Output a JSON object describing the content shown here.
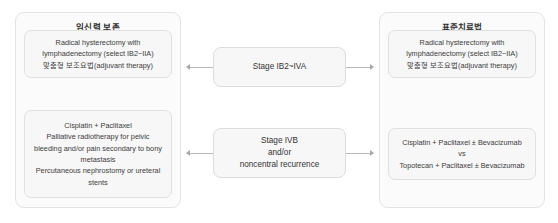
{
  "diagram": {
    "type": "flowchart",
    "left_panel": {
      "title": "임신력 보존",
      "boxes": [
        {
          "name": "fertility-preservation-surgery-box",
          "lines": [
            "Radical hysterectomy with",
            "lymphadenectomy (select IB2~IIA)",
            "맞춤형 보조요법(adjuvant therapy)"
          ]
        },
        {
          "name": "fertility-preservation-palliative-box",
          "lines": [
            "Cisplatin + Paclitaxel",
            "Palliative radiotherapy for pelvic",
            "bleeding and/or pain secondary to bony",
            "metastasis",
            "Percutaneous nephrostomy or ureteral",
            "stents"
          ]
        }
      ]
    },
    "right_panel": {
      "title": "표준치료법",
      "boxes": [
        {
          "name": "standard-surgery-box",
          "lines": [
            "Radical hysterectomy with",
            "lymphadenectomy (select IB2~IIA)",
            "맞춤형 보조요법(adjuvant therapy)"
          ]
        },
        {
          "name": "standard-chemotherapy-box",
          "lines": [
            "Cisplatin + Paclitaxel ± Bevacizumab",
            "vs",
            "Topotecan + Paclitaxel ± Bevacizumab"
          ]
        }
      ]
    },
    "stages": [
      {
        "name": "stage-ib2-iva",
        "lines": [
          "Stage IB2~IVA"
        ]
      },
      {
        "name": "stage-ivb",
        "lines": [
          "Stage IVB",
          "and/or",
          "noncentral recurrence"
        ]
      }
    ]
  }
}
